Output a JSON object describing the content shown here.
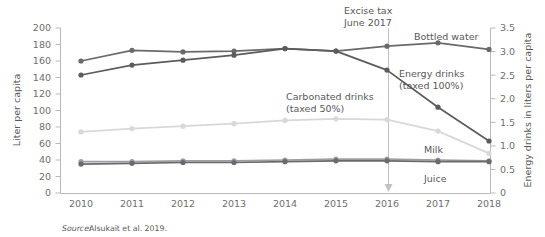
{
  "chart_data": {
    "type": "line",
    "title": "",
    "subtitle": "",
    "xlabel": "",
    "ylabel": "Liter per capita",
    "y2label": "Energy drinks in liters per capita",
    "x": [
      2010,
      2011,
      2012,
      2013,
      2014,
      2015,
      2016,
      2017,
      2018
    ],
    "xticklabels": [
      "2010",
      "2011",
      "2012",
      "2013",
      "2014",
      "2015",
      "2016",
      "2017",
      "2018"
    ],
    "ylim": [
      0,
      200
    ],
    "yticks": [
      0,
      20,
      40,
      60,
      80,
      100,
      120,
      140,
      160,
      180,
      200
    ],
    "yticklabels": [
      "0",
      "20",
      "40",
      "60",
      "80",
      "100",
      "120",
      "140",
      "160",
      "180",
      "200"
    ],
    "y2lim": [
      0,
      3.5
    ],
    "y2ticks": [
      0,
      0.5,
      1.0,
      1.5,
      2.0,
      2.5,
      3.0,
      3.5
    ],
    "y2ticklabels": [
      "0",
      "0.5",
      "1.0",
      "1.5",
      "2.0",
      "2.5",
      "3.0",
      "3.5"
    ],
    "grid": false,
    "legend": "inline-labels",
    "series": [
      {
        "name": "Bottled water",
        "label": "Bottled water",
        "axis": "left",
        "color": "#6a6a6c",
        "values": [
          160,
          173,
          171,
          172,
          175,
          172,
          178,
          182,
          174
        ]
      },
      {
        "name": "Energy drinks",
        "label": "Energy drinks",
        "label_line2": "(taxed 100%)",
        "axis": "right",
        "color": "#5c5c5e",
        "values": [
          2.5,
          2.71,
          2.81,
          2.93,
          3.06,
          3.01,
          2.6,
          1.81,
          1.1
        ],
        "values_left_scale": [
          143,
          155,
          161,
          167,
          175,
          172,
          149,
          104,
          63
        ]
      },
      {
        "name": "Carbonated drinks",
        "label": "Carbonated drinks",
        "label_line2": "(taxed  50%)",
        "axis": "left",
        "color": "#d8d8da",
        "values": [
          74,
          78,
          81,
          84,
          88,
          90,
          89,
          75,
          48
        ]
      },
      {
        "name": "Milk",
        "label": "Milk",
        "axis": "left",
        "color": "#9e9ea0",
        "values": [
          38,
          38,
          39,
          39,
          40,
          41,
          41,
          40,
          39
        ]
      },
      {
        "name": "Juice",
        "label": "Juice",
        "axis": "left",
        "color": "#6a6a6c",
        "values": [
          35,
          36,
          37,
          37,
          38,
          39,
          39,
          38,
          38
        ]
      }
    ],
    "annotations": [
      {
        "name": "excise-tax-event",
        "line1": "Excise tax",
        "line2": "June 2017",
        "x_position": 2016.45,
        "marker": "vertical-line-with-down-arrow"
      }
    ],
    "source": {
      "prefix": "Source:",
      "text": "Alsukait et al. 2019."
    }
  }
}
